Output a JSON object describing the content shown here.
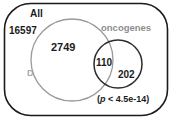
{
  "figure": {
    "type": "venn-diagram",
    "universe": {
      "name": "universe-box",
      "label": "All",
      "count": "16597",
      "shape": "rounded-rectangle",
      "stroke": "#1b1b1b"
    },
    "sets": [
      {
        "name": "set-d",
        "label": "D",
        "exclusive_count": "2749",
        "stroke": "#9a9a9a",
        "label_color": "#a8a8a8"
      },
      {
        "name": "set-oncogenes",
        "label": "oncogenes",
        "exclusive_count": "202",
        "stroke": "#2b2b2b",
        "label_color": "#8e8e8e"
      }
    ],
    "intersection": {
      "name": "intersection-d-oncogenes",
      "count": "110"
    },
    "annotation": {
      "name": "p-value-annotation",
      "prefix": "(",
      "symbol": "p",
      "text": " < 4.5e-14)",
      "full": "(p < 4.5e-14)"
    }
  }
}
